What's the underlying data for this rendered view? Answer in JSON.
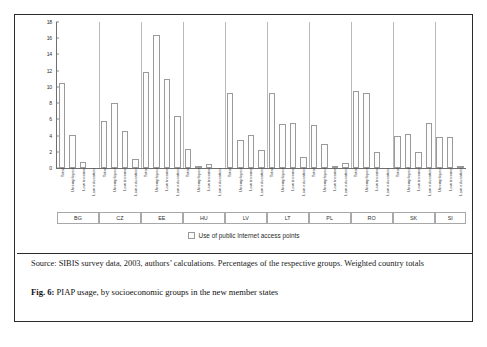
{
  "figure": {
    "source_text": "Source: SIBIS survey data, 2003, authors’ calculations. Percentages of the respective groups. Weighted country totals",
    "caption_prefix": "Fig. 6:",
    "caption_text": "PIAP usage, by socioeconomic groups in the new member states"
  },
  "chart_data": {
    "type": "bar",
    "title": "",
    "xlabel": "",
    "ylabel": "",
    "ylim": [
      0,
      18
    ],
    "yticks": [
      0,
      2,
      4,
      6,
      8,
      10,
      12,
      14,
      16,
      18
    ],
    "grid": false,
    "legend": {
      "position": "bottom-center",
      "entries": [
        "Use of public Internet access points"
      ]
    },
    "series_name": "Use of public Internet access points",
    "groups": [
      {
        "code": "BG",
        "categories": [
          "Total",
          "Unemployed",
          "Low income",
          "Low education"
        ],
        "values": [
          10.5,
          4.1,
          0.8,
          0.0
        ]
      },
      {
        "code": "CZ",
        "categories": [
          "Total",
          "Unemployed",
          "Low income",
          "Low education"
        ],
        "values": [
          5.8,
          8.0,
          4.6,
          1.1
        ]
      },
      {
        "code": "EE",
        "categories": [
          "Total",
          "Unemployed",
          "Low income",
          "Low education"
        ],
        "values": [
          11.8,
          16.4,
          11.0,
          6.4
        ]
      },
      {
        "code": "HU",
        "categories": [
          "Total",
          "Unemployed",
          "Low income",
          "Low education"
        ],
        "values": [
          2.3,
          0.2,
          0.5,
          0.0
        ]
      },
      {
        "code": "LV",
        "categories": [
          "Total",
          "Unemployed",
          "Low income",
          "Low education"
        ],
        "values": [
          9.2,
          3.5,
          4.1,
          2.2
        ]
      },
      {
        "code": "LT",
        "categories": [
          "Total",
          "Unemployed",
          "Low income",
          "Low education"
        ],
        "values": [
          9.3,
          5.4,
          5.5,
          1.4
        ]
      },
      {
        "code": "PL",
        "categories": [
          "Total",
          "Unemployed",
          "Low income",
          "Low education"
        ],
        "values": [
          5.3,
          3.0,
          0.1,
          0.6
        ]
      },
      {
        "code": "RO",
        "categories": [
          "Total",
          "Unemployed",
          "Low income",
          "Low education"
        ],
        "values": [
          9.5,
          9.3,
          2.0,
          0.0
        ]
      },
      {
        "code": "SK",
        "categories": [
          "Total",
          "Unemployed",
          "Low income",
          "Low education"
        ],
        "values": [
          4.0,
          4.2,
          2.0,
          5.5
        ]
      },
      {
        "code": "SI",
        "categories": [
          "Unemployed",
          "Low income",
          "Low education"
        ],
        "values": [
          3.8,
          3.8,
          0.1
        ]
      }
    ]
  }
}
